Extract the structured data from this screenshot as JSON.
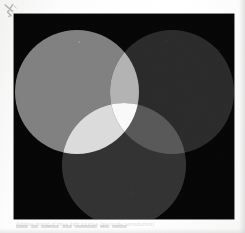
{
  "page": {
    "background_color": "#fbfbfa",
    "plate_color": "#050505",
    "plate_bounds": {
      "x": 14,
      "y": 14,
      "width": 220,
      "height": 205
    },
    "pen_mark_label": "handwritten-ink-mark",
    "caption_text": "Additive mixing of three light sources (greyscale reproduction)"
  },
  "chart_data": {
    "type": "venn",
    "subtitle": "",
    "xlabel": "",
    "ylabel": "",
    "legend_position": "none",
    "grid": false,
    "background": "#050505",
    "circles": [
      {
        "name": "left-circle",
        "label": "Source A (left)",
        "cx": 63,
        "cy": 78,
        "r": 62,
        "fill": "#808080",
        "luminance": 128
      },
      {
        "name": "right-circle",
        "label": "Source B (right)",
        "cx": 158,
        "cy": 78,
        "r": 62,
        "fill": "#2b2b2b",
        "luminance": 43
      },
      {
        "name": "bottom-circle",
        "label": "Source C (bottom)",
        "cx": 110,
        "cy": 151,
        "r": 62,
        "fill": "#333333",
        "luminance": 51
      }
    ],
    "overlaps": [
      {
        "name": "left-right-overlap",
        "label": "A + B",
        "fill": "#b3b3b3",
        "luminance": 179
      },
      {
        "name": "left-bottom-overlap",
        "label": "A + C",
        "fill": "#dcdcdc",
        "luminance": 220
      },
      {
        "name": "right-bottom-overlap",
        "label": "B + C",
        "fill": "#595959",
        "luminance": 89
      },
      {
        "name": "center-overlap",
        "label": "A + B + C",
        "fill": "#fafafa",
        "luminance": 250
      }
    ]
  }
}
